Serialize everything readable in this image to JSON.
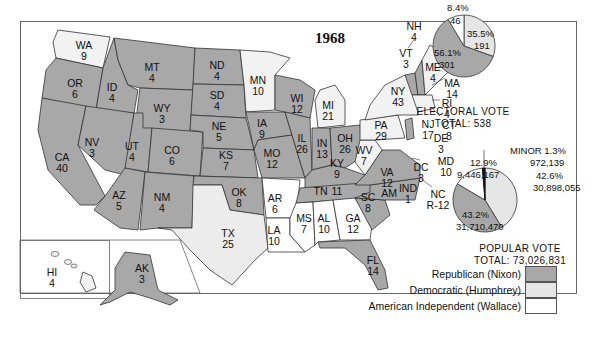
{
  "title": "1968",
  "colors": {
    "republican": "#a8a8a8",
    "democratic": "#e6e6e6",
    "independent": "#ffffff",
    "border": "#333333"
  },
  "legend": [
    {
      "label": "Republican (Nixon)",
      "color": "#a8a8a8"
    },
    {
      "label": "Democratic (Humphrey)",
      "color": "#e6e6e6"
    },
    {
      "label": "American Independent (Wallace)",
      "color": "#ffffff"
    }
  ],
  "electoral_vote": {
    "caption_line1": "ELECTORAL VOTE",
    "caption_line2": "TOTAL: 538",
    "slices": [
      {
        "party": "Republican",
        "pct": "56.1%",
        "value": "301"
      },
      {
        "party": "Democratic",
        "pct": "35.5%",
        "value": "191"
      },
      {
        "party": "American Independent",
        "pct": "8.4%",
        "value": "46"
      }
    ]
  },
  "popular_vote": {
    "caption_line1": "POPULAR VOTE",
    "caption_line2": "TOTAL: 73,026,831",
    "slices": [
      {
        "party": "Republican",
        "pct": "43.2%",
        "value": "31,710,470"
      },
      {
        "party": "Democratic",
        "pct": "42.6%",
        "value": "30,898,055"
      },
      {
        "party": "American Independent",
        "pct": "12.9%",
        "value": "9,446,167"
      },
      {
        "party": "Minor",
        "label": "MINOR 1.3%",
        "value": "972,139"
      }
    ]
  },
  "states": [
    {
      "abbr": "WA",
      "ev": "9",
      "party": "D"
    },
    {
      "abbr": "OR",
      "ev": "6",
      "party": "R"
    },
    {
      "abbr": "CA",
      "ev": "40",
      "party": "R"
    },
    {
      "abbr": "ID",
      "ev": "4",
      "party": "R"
    },
    {
      "abbr": "NV",
      "ev": "3",
      "party": "R"
    },
    {
      "abbr": "MT",
      "ev": "4",
      "party": "R"
    },
    {
      "abbr": "WY",
      "ev": "3",
      "party": "R"
    },
    {
      "abbr": "UT",
      "ev": "4",
      "party": "R"
    },
    {
      "abbr": "CO",
      "ev": "6",
      "party": "R"
    },
    {
      "abbr": "AZ",
      "ev": "5",
      "party": "R"
    },
    {
      "abbr": "NM",
      "ev": "4",
      "party": "R"
    },
    {
      "abbr": "ND",
      "ev": "4",
      "party": "R"
    },
    {
      "abbr": "SD",
      "ev": "4",
      "party": "R"
    },
    {
      "abbr": "NE",
      "ev": "5",
      "party": "R"
    },
    {
      "abbr": "KS",
      "ev": "7",
      "party": "R"
    },
    {
      "abbr": "OK",
      "ev": "8",
      "party": "R"
    },
    {
      "abbr": "TX",
      "ev": "25",
      "party": "D"
    },
    {
      "abbr": "MN",
      "ev": "10",
      "party": "D"
    },
    {
      "abbr": "IA",
      "ev": "9",
      "party": "R"
    },
    {
      "abbr": "MO",
      "ev": "12",
      "party": "R"
    },
    {
      "abbr": "AR",
      "ev": "6",
      "party": "AI"
    },
    {
      "abbr": "LA",
      "ev": "10",
      "party": "AI"
    },
    {
      "abbr": "WI",
      "ev": "12",
      "party": "R"
    },
    {
      "abbr": "IL",
      "ev": "26",
      "party": "R"
    },
    {
      "abbr": "MI",
      "ev": "21",
      "party": "D"
    },
    {
      "abbr": "IN",
      "ev": "13",
      "party": "R"
    },
    {
      "abbr": "OH",
      "ev": "26",
      "party": "R"
    },
    {
      "abbr": "KY",
      "ev": "9",
      "party": "R"
    },
    {
      "abbr": "TN",
      "ev": "11",
      "party": "R"
    },
    {
      "abbr": "MS",
      "ev": "7",
      "party": "AI"
    },
    {
      "abbr": "AL",
      "ev": "10",
      "party": "AI"
    },
    {
      "abbr": "GA",
      "ev": "12",
      "party": "AI"
    },
    {
      "abbr": "FL",
      "ev": "14",
      "party": "R"
    },
    {
      "abbr": "SC",
      "ev": "8",
      "party": "R"
    },
    {
      "abbr": "NC",
      "ev": "12",
      "party": "R",
      "note": "R-12",
      "note2": "AM IND 1"
    },
    {
      "abbr": "VA",
      "ev": "12",
      "party": "R"
    },
    {
      "abbr": "WV",
      "ev": "7",
      "party": "D"
    },
    {
      "abbr": "PA",
      "ev": "29",
      "party": "D"
    },
    {
      "abbr": "NY",
      "ev": "43",
      "party": "D"
    },
    {
      "abbr": "VT",
      "ev": "3",
      "party": "R"
    },
    {
      "abbr": "NH",
      "ev": "4",
      "party": "R"
    },
    {
      "abbr": "ME",
      "ev": "4",
      "party": "D"
    },
    {
      "abbr": "MA",
      "ev": "14",
      "party": "D"
    },
    {
      "abbr": "RI",
      "ev": "4",
      "party": "D"
    },
    {
      "abbr": "CT",
      "ev": "8",
      "party": "D"
    },
    {
      "abbr": "NJ",
      "ev": "17",
      "party": "R"
    },
    {
      "abbr": "DE",
      "ev": "3",
      "party": "R"
    },
    {
      "abbr": "MD",
      "ev": "10",
      "party": "D"
    },
    {
      "abbr": "DC",
      "ev": "3",
      "party": "D"
    },
    {
      "abbr": "AK",
      "ev": "3",
      "party": "R"
    },
    {
      "abbr": "HI",
      "ev": "4",
      "party": "D"
    }
  ],
  "nc_split": {
    "line1": "AM",
    "line2": "IND",
    "line3": "1",
    "note_label": "NC",
    "note_value": "R-12"
  }
}
